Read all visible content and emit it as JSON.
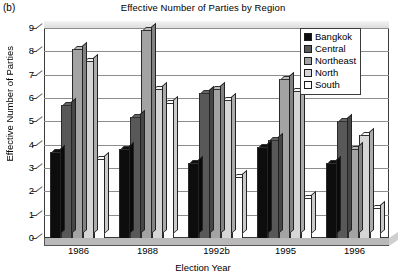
{
  "panel_label": "(b)",
  "chart_data": {
    "type": "bar",
    "title": "Effective Number of Parties by Region",
    "xlabel": "Election Year",
    "ylabel": "Effective Number of Parties",
    "categories": [
      "1986",
      "1988",
      "1992b",
      "1995",
      "1996"
    ],
    "ylim": [
      0,
      9
    ],
    "yticks": [
      0,
      1,
      2,
      3,
      4,
      5,
      6,
      7,
      8,
      9
    ],
    "grid": true,
    "legend_position": "top-right",
    "series": [
      {
        "name": "Bangkok",
        "color": "#0d0d0d",
        "values": [
          3.7,
          3.8,
          3.2,
          3.9,
          3.2
        ]
      },
      {
        "name": "Central",
        "color": "#585858",
        "values": [
          5.7,
          5.2,
          6.2,
          4.2,
          5.0
        ]
      },
      {
        "name": "Northeast",
        "color": "#a3a3a3",
        "values": [
          8.1,
          8.9,
          6.4,
          6.8,
          3.8
        ]
      },
      {
        "name": "North",
        "color": "#d6d6d6",
        "values": [
          7.6,
          6.4,
          5.9,
          6.3,
          4.4
        ]
      },
      {
        "name": "South",
        "color": "#fdfdfd",
        "values": [
          3.4,
          5.8,
          2.6,
          1.7,
          1.3
        ]
      }
    ]
  }
}
